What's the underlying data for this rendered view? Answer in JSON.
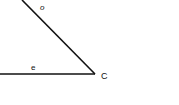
{
  "diagram": {
    "type": "angle",
    "vertex": {
      "label": "C",
      "x": 95,
      "y": 74
    },
    "rays": [
      {
        "name": "slanted-side",
        "label": "o",
        "from": [
          22,
          0
        ],
        "to": [
          95,
          74
        ]
      },
      {
        "name": "horizontal-side",
        "label": "e",
        "from": [
          0,
          74
        ],
        "to": [
          95,
          74
        ]
      }
    ],
    "colors": {
      "stroke": "#111111",
      "background": "#ffffff"
    }
  }
}
